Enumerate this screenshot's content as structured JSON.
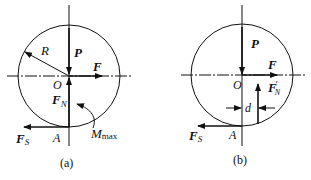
{
  "figures": [
    {
      "id": "a",
      "caption": "(a)",
      "labels": {
        "P": "P",
        "F": "F",
        "O": "O",
        "R": "R",
        "FN": "F",
        "FN_sub": "N",
        "FS": "F",
        "FS_sub": "S",
        "A": "A",
        "M": "M",
        "M_sub": "max"
      }
    },
    {
      "id": "b",
      "caption": "(b)",
      "labels": {
        "P": "P",
        "F": "F",
        "O": "O",
        "FN": "F",
        "FN_prime": "′",
        "FN_sub": "N",
        "d": "d",
        "FS": "F",
        "FS_sub": "S",
        "A": "A"
      }
    }
  ],
  "colors": {
    "stroke": "#111111",
    "background": "#ffffff"
  }
}
